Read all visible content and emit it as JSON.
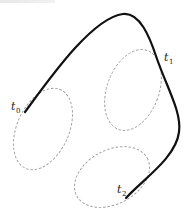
{
  "diagram": {
    "type": "trajectory-with-regions",
    "colors": {
      "curve": "#111111",
      "region_outline": "#9a9a9a",
      "label": "#222222",
      "background": "#ffffff"
    },
    "curve": {
      "style": "solid-thick",
      "path": "M 25 112 C 50 78, 92 18, 123 14 C 140 12, 150 38, 156 56 C 166 86, 182 112, 179 132 C 176 158, 142 180, 126 198"
    },
    "regions": [
      {
        "name": "region-0",
        "cx": 43,
        "cy": 129,
        "rx": 26,
        "ry": 43,
        "rotate": 24
      },
      {
        "name": "region-1",
        "cx": 133,
        "cy": 90,
        "rx": 26,
        "ry": 42,
        "rotate": 20
      },
      {
        "name": "region-2",
        "cx": 112,
        "cy": 177,
        "rx": 40,
        "ry": 27,
        "rotate": -28
      }
    ],
    "labels": [
      {
        "name": "t0",
        "base": "t",
        "sub": "0",
        "x": 11,
        "y": 110
      },
      {
        "name": "t1",
        "base": "t",
        "sub": "1",
        "x": 164,
        "y": 61
      },
      {
        "name": "t2",
        "base": "t",
        "sub": "2",
        "x": 117,
        "y": 193
      }
    ]
  }
}
